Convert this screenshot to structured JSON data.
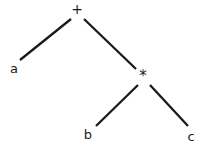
{
  "diagram": {
    "type": "expression-tree",
    "title": "",
    "background_color": "#ffffff",
    "stroke_color": "#1a1a1a",
    "text_color": "#1a1a1a",
    "stroke_width": 2.3,
    "expression": "a + b * c",
    "nodes": [
      {
        "id": "root",
        "label": "+",
        "kind": "operator",
        "x": 77,
        "y": 9,
        "role": "root"
      },
      {
        "id": "left",
        "label": "a",
        "kind": "operand",
        "x": 14,
        "y": 68,
        "role": "leaf"
      },
      {
        "id": "mul",
        "label": "*",
        "kind": "operator",
        "x": 143,
        "y": 76,
        "role": "internal"
      },
      {
        "id": "mleft",
        "label": "b",
        "kind": "operand",
        "x": 88,
        "y": 134,
        "role": "leaf"
      },
      {
        "id": "mright",
        "label": "c",
        "kind": "operand",
        "x": 191,
        "y": 136,
        "role": "leaf"
      }
    ],
    "edges": [
      {
        "id": "edge-root-a",
        "from": "root",
        "to": "left",
        "x1": 71,
        "y1": 19,
        "x2": 20,
        "y2": 60
      },
      {
        "id": "edge-root-mul",
        "from": "root",
        "to": "mul",
        "x1": 84,
        "y1": 19,
        "x2": 136,
        "y2": 69
      },
      {
        "id": "edge-mul-b",
        "from": "mul",
        "to": "mleft",
        "x1": 138,
        "y1": 85,
        "x2": 96,
        "y2": 126
      },
      {
        "id": "edge-mul-c",
        "from": "mul",
        "to": "mright",
        "x1": 150,
        "y1": 85,
        "x2": 188,
        "y2": 126
      }
    ]
  }
}
